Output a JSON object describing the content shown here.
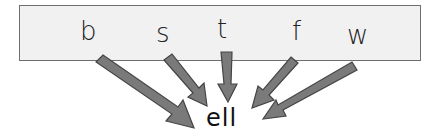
{
  "diagram": {
    "onsets": [
      {
        "label": "b",
        "x": 80,
        "y": 18
      },
      {
        "label": "s",
        "x": 156,
        "y": 18
      },
      {
        "label": "t",
        "x": 217,
        "y": 16
      },
      {
        "label": "f",
        "x": 291,
        "y": 20
      },
      {
        "label": "w",
        "x": 347,
        "y": 22
      }
    ],
    "rime": "ell",
    "colors": {
      "box_fill": "#f1f1f1",
      "box_border": "#6e6e6e",
      "arrow_fill": "#7a7a7a",
      "arrow_stroke": "#444444"
    }
  }
}
